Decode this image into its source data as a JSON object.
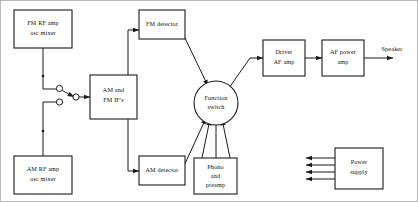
{
  "diagram": {
    "frame_color": "#b8b8b8",
    "line_color": "#1a1a1a",
    "background": "#ffffff",
    "blocks": [
      {
        "id": "fm_rf",
        "lines": [
          "FM RF amp",
          "osc mixer"
        ]
      },
      {
        "id": "am_rf",
        "lines": [
          "AM RF amp",
          "osc mixer"
        ]
      },
      {
        "id": "if",
        "lines": [
          "AM and",
          "FM IF's"
        ]
      },
      {
        "id": "fm_det",
        "lines": [
          "FM detector"
        ]
      },
      {
        "id": "am_det",
        "lines": [
          "AM detector"
        ]
      },
      {
        "id": "phono",
        "lines": [
          "Phono",
          "and",
          "preamp"
        ]
      },
      {
        "id": "fn_switch",
        "lines": [
          "Function",
          "switch"
        ]
      },
      {
        "id": "driver",
        "lines": [
          "Driver",
          "AF amp"
        ]
      },
      {
        "id": "af_power",
        "lines": [
          "AF power",
          "amp"
        ]
      },
      {
        "id": "power_sup",
        "lines": [
          "Power",
          "supply"
        ]
      }
    ],
    "labels": {
      "speaker": "Speaker"
    }
  }
}
